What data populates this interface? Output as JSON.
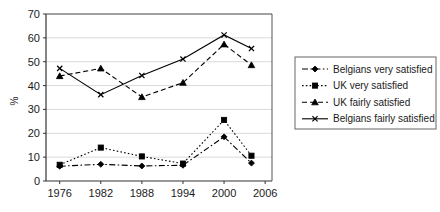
{
  "chart_data": {
    "type": "line",
    "title": "",
    "subtitle": "",
    "xlabel": "",
    "ylabel": "%",
    "x": [
      1976,
      1982,
      1988,
      1994,
      2000,
      2004
    ],
    "xtick_labels": [
      "1976",
      "1982",
      "1988",
      "1994",
      "2000",
      "2006"
    ],
    "xtick_values": [
      1976,
      1982,
      1988,
      1994,
      2000,
      2006
    ],
    "xlim": [
      1974,
      2007
    ],
    "ylim": [
      0,
      70
    ],
    "ytick_labels": [
      "0",
      "10",
      "20",
      "30",
      "40",
      "50",
      "60",
      "70"
    ],
    "ytick_values": [
      0,
      10,
      20,
      30,
      40,
      50,
      60,
      70
    ],
    "grid": true,
    "grid_axis": "y",
    "legend_position": "right",
    "series": [
      {
        "name": "Belgians very satisfied",
        "marker": "diamond",
        "dash": "dash-dot",
        "values": [
          6.2,
          7.0,
          6.3,
          6.6,
          18.5,
          7.5
        ]
      },
      {
        "name": "UK very satisfied",
        "marker": "square",
        "dash": "dotted",
        "values": [
          6.8,
          14.0,
          10.3,
          7.3,
          25.6,
          10.6
        ]
      },
      {
        "name": "UK fairly satisfied",
        "marker": "triangle",
        "dash": "dashed",
        "values": [
          44.0,
          47.2,
          35.2,
          41.2,
          57.3,
          48.6
        ]
      },
      {
        "name": "Belgians fairly satisfied",
        "marker": "x",
        "dash": "solid",
        "values": [
          47.2,
          36.2,
          44.2,
          51.1,
          61.2,
          55.5
        ]
      }
    ]
  },
  "legend": {
    "entries": [
      {
        "label": "Belgians very satisfied"
      },
      {
        "label": "UK very satisfied"
      },
      {
        "label": "UK fairly satisfied"
      },
      {
        "label": "Belgians fairly satisfied"
      }
    ]
  },
  "axis": {
    "y_title": "%"
  },
  "colors": {
    "ink": "#000000",
    "grid": "#c8c8c8",
    "axis": "#333333",
    "frame": "#555555",
    "background": "#ffffff"
  }
}
